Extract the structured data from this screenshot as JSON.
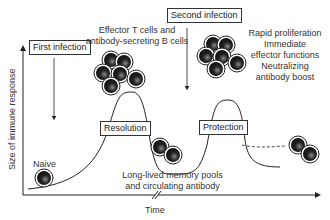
{
  "diagram": {
    "axes": {
      "y_label": "Size of immune response",
      "x_label": "Time"
    },
    "events": {
      "first_infection": "First infection",
      "second_infection": "Second infection"
    },
    "phases": {
      "resolution": "Resolution",
      "protection": "Protection"
    },
    "annotations": {
      "naive": "Naive",
      "effector_line1": "Effector T cells and",
      "effector_line2": "antibody-secreting B cells",
      "memory_line1": "Long-lived memory pools",
      "memory_line2": "and circulating antibody",
      "secondary_line1": "Rapid proliferation",
      "secondary_line2": "Immediate",
      "secondary_line3": "effector functions",
      "secondary_line4": "Neutralizing",
      "secondary_line5": "antibody boost"
    },
    "colors": {
      "line": "#222222",
      "cell_fill": "#1a1a1a",
      "cell_highlight": "#777777"
    }
  }
}
